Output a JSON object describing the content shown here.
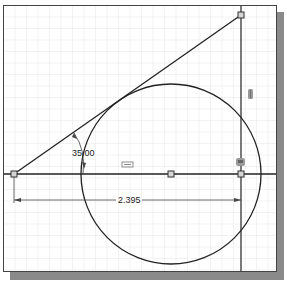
{
  "sketch": {
    "angle_dimension": "35.00",
    "linear_dimension": "2.395",
    "colors": {
      "line": "#222222",
      "grid_minor": "#e4e4e4",
      "grid_major": "#c8c8c8",
      "shadow": "#8a8a8a",
      "constraint_glyph": "#8c8c8c"
    },
    "points": [
      {
        "name": "left-endpoint",
        "x": 14,
        "y": 174
      },
      {
        "name": "top-endpoint",
        "x": 241,
        "y": 15
      },
      {
        "name": "circle-center",
        "x": 171,
        "y": 174
      },
      {
        "name": "right-intersection",
        "x": 241,
        "y": 174
      }
    ],
    "circle": {
      "cx": 171,
      "cy": 174,
      "r": 90
    },
    "constraint_icons": [
      "parallel-constraint",
      "vertical-constraint",
      "coincident-constraint",
      "horizontal-constraint"
    ]
  }
}
